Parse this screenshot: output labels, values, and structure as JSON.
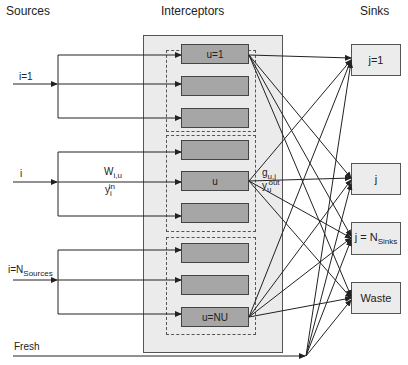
{
  "headers": {
    "sources": "Sources",
    "interceptors": "Interceptors",
    "sinks": "Sinks"
  },
  "sources": [
    {
      "label": "i=1"
    },
    {
      "label": "i"
    },
    {
      "label_main": "i=N",
      "label_sub": "Sources"
    },
    {
      "label": "Fresh"
    }
  ],
  "flow_labels": {
    "w_main": "W",
    "w_sub": "i,u",
    "yin_main": "y",
    "yin_sub": "i",
    "yin_sup": "in",
    "g_main": "g",
    "g_sub": "u,j",
    "yout_main": "y",
    "yout_sub": "u",
    "yout_sup": "out"
  },
  "interceptors": {
    "units": [
      "u=1",
      "",
      "",
      "",
      "u",
      "",
      "",
      "",
      "u=NU"
    ]
  },
  "sinks": [
    {
      "label": "j=1"
    },
    {
      "label": "j"
    },
    {
      "label_main": "j = N",
      "label_sub": "Sinks"
    },
    {
      "label": "Waste"
    }
  ],
  "colors": {
    "interceptor_bg": "#ebebeb",
    "unit_fill": "#a6a6a6",
    "sink_fill": "#ececec",
    "line": "#222222"
  }
}
